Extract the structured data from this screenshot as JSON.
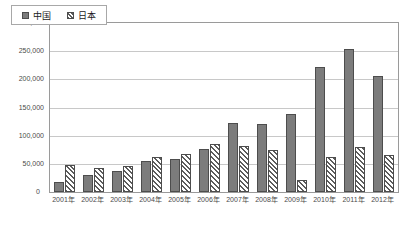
{
  "chart_data": {
    "type": "bar",
    "title": "",
    "subtitle": "",
    "unit_label": "(台数)",
    "xlabel": "",
    "ylabel": "",
    "ylim": [
      0,
      300000
    ],
    "ytick_values": [
      0,
      50000,
      100000,
      150000,
      200000,
      250000,
      300000
    ],
    "ytick_labels": [
      "0",
      "50,000",
      "100,000",
      "150,000",
      "200,000",
      "250,000",
      "300,000"
    ],
    "grid": true,
    "grid_axis": "y",
    "legend_position": "top-left",
    "categories": [
      "2001年",
      "2002年",
      "2003年",
      "2004年",
      "2005年",
      "2006年",
      "2007年",
      "2008年",
      "2009年",
      "2010年",
      "2011年",
      "2012年"
    ],
    "series": [
      {
        "name": "中国",
        "fill": "solid-gray",
        "color": "#7c7c7c",
        "values": [
          17000,
          30000,
          37000,
          55000,
          58000,
          77000,
          123000,
          120000,
          139000,
          222000,
          254000,
          206000
        ]
      },
      {
        "name": "日本",
        "fill": "diagonal-hatch",
        "color": "#5c5c5c",
        "values": [
          48000,
          43000,
          46000,
          62000,
          68000,
          85000,
          82000,
          74000,
          21000,
          62000,
          80000,
          66000
        ]
      }
    ]
  },
  "colors": {
    "china_bar": "#7c7c7c",
    "japan_hatch": "#5c5c5c",
    "bar_border": "#4d4d4d",
    "gridline": "#c8c8c8",
    "plot_border": "#9a9a9a",
    "axis_text": "#4a4a4a",
    "background": "#ffffff"
  }
}
